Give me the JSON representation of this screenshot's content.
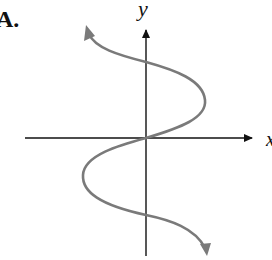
{
  "figure": {
    "option_label": "A.",
    "y_axis_label": "y",
    "x_axis_label": "x"
  },
  "colors": {
    "axes": "#111111",
    "curve": "#7a7a7a",
    "background": "#ffffff"
  },
  "geometry": {
    "origin": [
      146,
      138
    ],
    "x_axis": {
      "from": 25,
      "to": 252
    },
    "y_axis": {
      "from": 28,
      "to": 256
    },
    "curve_description": "sideways sine-like curve (x as a function of y), passing through origin, bulging right above x-axis and left below, with arrowheads at both ends"
  }
}
